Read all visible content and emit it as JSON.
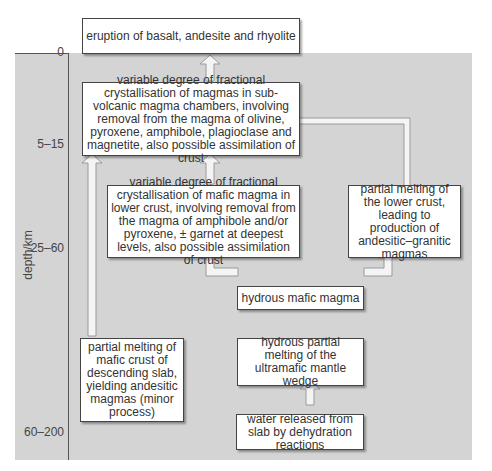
{
  "axis": {
    "label": "depth/km",
    "ticks": [
      {
        "label": "0"
      },
      {
        "label": "5–15"
      },
      {
        "label": "25–60"
      },
      {
        "label": "60–200"
      }
    ]
  },
  "boxes": {
    "eruption": "eruption of basalt, andesite and rhyolite",
    "fractional_subvolcanic": "variable degree of fractional crystallisation of magmas in sub-volcanic magma chambers, involving removal from the magma of olivine, pyroxene, amphibole, plagioclase and magnetite, also possible assimilation of crust",
    "fractional_lower_crust": "variable degree of fractional crystallisation of mafic magma in lower crust, involving removal from the magma of amphibole and/or pyroxene, ± garnet at deepest levels, also possible assimilation of crust",
    "partial_melting_lower_crust": "partial melting of the lower crust, leading to production of andesitic–granitic magmas",
    "hydrous_mafic_magma": "hydrous mafic magma",
    "hydrous_partial_melting": "hydrous partial melting of the ultramafic mantle wedge",
    "partial_melting_slab": "partial melting of mafic crust of descending slab, yielding andesitic magmas (minor process)",
    "water_released": "water released from slab by dehydration reactions"
  },
  "colors": {
    "panel": "#d4d4d4",
    "box_fill": "#ffffff",
    "box_border": "#444444",
    "arrow_fill": "#f4f4f4",
    "arrow_stroke": "#9a9a9a"
  }
}
